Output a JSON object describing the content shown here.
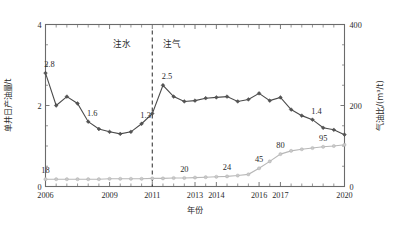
{
  "chart_data": {
    "type": "line",
    "title": "",
    "xlabel": "年份",
    "ylabel": "单井日产油量/t",
    "y2label": "气油比/(m³/t)",
    "xlim": [
      2006,
      2020
    ],
    "ylim": [
      0,
      4
    ],
    "y2lim": [
      0,
      400
    ],
    "yticks": [
      "0",
      "2",
      "4"
    ],
    "y2ticks": [
      "0",
      "200",
      "400"
    ],
    "xticklabels": [
      "2006",
      "2009",
      "2011",
      "2013",
      "2014",
      "2016",
      "2017",
      "2020"
    ],
    "xtickvalues": [
      2006,
      2009,
      2011,
      2013,
      2014,
      2016,
      2017,
      2020
    ],
    "grid": false,
    "legend": "none",
    "annotations": [
      {
        "text": "注水",
        "x": 2009.6,
        "y": 3.45
      },
      {
        "text": "注气",
        "x": 2011.9,
        "y": 3.45
      }
    ],
    "vline": {
      "x": 2011.0,
      "style": "dashed",
      "label": ""
    },
    "x": [
      2006,
      2006.5,
      2007,
      2007.5,
      2008,
      2008.5,
      2009,
      2009.5,
      2010,
      2010.5,
      2011,
      2011.5,
      2012,
      2012.5,
      2013,
      2013.5,
      2014,
      2014.5,
      2015,
      2015.5,
      2016,
      2016.5,
      2017,
      2017.5,
      2018,
      2018.5,
      2019,
      2019.5,
      2020
    ],
    "series": [
      {
        "name": "单井日产油量",
        "axis": "left",
        "unit": "t",
        "color": "#4b4b4b",
        "marker": "diamond",
        "values": [
          2.8,
          2.0,
          2.22,
          2.05,
          1.6,
          1.42,
          1.35,
          1.3,
          1.35,
          1.55,
          1.8,
          2.5,
          2.22,
          2.1,
          2.12,
          2.18,
          2.2,
          2.22,
          2.1,
          2.15,
          2.3,
          2.12,
          2.2,
          1.9,
          1.75,
          1.65,
          1.45,
          1.4,
          1.28
        ],
        "data_labels": [
          {
            "x": 2006,
            "value": "2.8"
          },
          {
            "x": 2008,
            "value": "1.6"
          },
          {
            "x": 2010.5,
            "value": "1.3"
          },
          {
            "x": 2011.5,
            "value": "2.5"
          },
          {
            "x": 2018.5,
            "value": "1.4"
          }
        ]
      },
      {
        "name": "气油比",
        "axis": "right",
        "unit": "m³/t",
        "color": "#b8b8b8",
        "marker": "circle",
        "values": [
          18,
          18,
          18,
          18,
          18,
          18,
          19,
          19,
          19,
          19,
          20,
          20,
          21,
          21,
          22,
          23,
          24,
          25,
          27,
          30,
          45,
          62,
          80,
          88,
          92,
          95,
          98,
          100,
          103
        ],
        "data_labels": [
          {
            "x": 2006,
            "value": "18"
          },
          {
            "x": 2012.5,
            "value": "20"
          },
          {
            "x": 2014.5,
            "value": "24"
          },
          {
            "x": 2016,
            "value": "45"
          },
          {
            "x": 2017,
            "value": "80"
          },
          {
            "x": 2019,
            "value": "95"
          }
        ]
      }
    ]
  },
  "figure": {
    "left_axis_title": "单井日产油量/t",
    "right_axis_title": "气油比/(m³/t)",
    "x_axis_title": "年份",
    "annotation_water": "注水",
    "annotation_gas": "注气",
    "accent_oil": "#4b4b4b",
    "accent_gor": "#b8b8b8"
  }
}
